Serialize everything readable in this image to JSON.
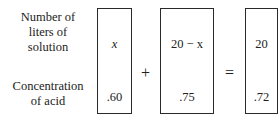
{
  "row_labels": {
    "row1": [
      "Number of",
      "liters of",
      "solution"
    ],
    "row2": [
      "Concentration",
      "of acid"
    ]
  },
  "boxes": [
    {
      "top": "x",
      "bottom": ".60"
    },
    {
      "top": "20 − x",
      "bottom": ".75"
    },
    {
      "top": "20",
      "bottom": ".72"
    }
  ],
  "operators": {
    "plus": "+",
    "equals": "="
  }
}
